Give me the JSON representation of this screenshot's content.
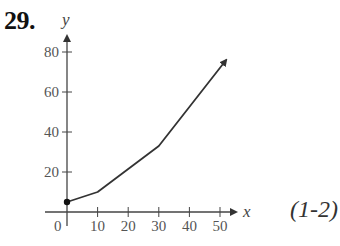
{
  "problem": {
    "number": "29.",
    "reference": "(1-2)"
  },
  "chart_data": {
    "type": "line",
    "title": "",
    "xlabel": "x",
    "ylabel": "y",
    "x_ticks": [
      10,
      20,
      30,
      40,
      50
    ],
    "y_ticks": [
      20,
      40,
      60,
      80
    ],
    "origin_label": "0",
    "xlim": [
      0,
      55
    ],
    "ylim": [
      0,
      85
    ],
    "grid": false,
    "series": [
      {
        "name": "y",
        "points": [
          {
            "x": 0,
            "y": 5
          },
          {
            "x": 10,
            "y": 10
          },
          {
            "x": 30,
            "y": 33
          },
          {
            "x": 52,
            "y": 76
          }
        ],
        "start_marker": "filled-dot",
        "end_marker": "arrow"
      }
    ],
    "colors": {
      "line": "#333333",
      "axes": "#444444"
    }
  }
}
